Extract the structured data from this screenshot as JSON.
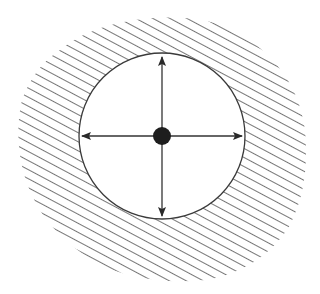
{
  "diagram": {
    "colors": {
      "background": "#ffffff",
      "stroke": "#3a3a3a",
      "hatch": "#3a3a3a",
      "center_dot": "#1e1e1e"
    },
    "circle": {
      "cx": 162,
      "cy": 136,
      "r": 83
    },
    "center_point": {
      "cx": 162,
      "cy": 136,
      "r": 9
    },
    "arrows": [
      {
        "direction": "up",
        "x2": 162,
        "y2": 56
      },
      {
        "direction": "down",
        "x2": 162,
        "y2": 216
      },
      {
        "direction": "left",
        "x2": 82,
        "y2": 136
      },
      {
        "direction": "right",
        "x2": 242,
        "y2": 136
      }
    ],
    "hatch_region": {
      "pattern": "diagonal-lines",
      "angle_deg": 28,
      "spacing": 8
    }
  }
}
